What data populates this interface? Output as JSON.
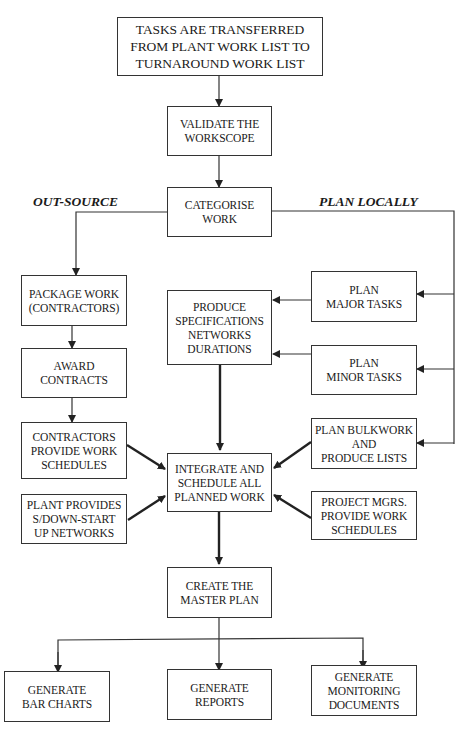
{
  "diagram": {
    "labels": {
      "outsource": "OUT-SOURCE",
      "plan_locally": "PLAN LOCALLY"
    },
    "nodes": {
      "transfer": "TASKS ARE TRANSFERRED\nFROM PLANT WORK LIST TO\nTURNAROUND WORK LIST",
      "validate": "VALIDATE THE\nWORKSCOPE",
      "categorise": "CATEGORISE\nWORK",
      "package": "PACKAGE WORK\n(CONTRACTORS)",
      "award": "AWARD\nCONTRACTS",
      "contractors_schedules": "CONTRACTORS\nPROVIDE WORK\nSCHEDULES",
      "plant_networks": "PLANT PROVIDES\nS/DOWN-START\nUP NETWORKS",
      "produce_specs": "PRODUCE\nSPECIFICATIONS\nNETWORKS\nDURATIONS",
      "plan_major": "PLAN\nMAJOR TASKS",
      "plan_minor": "PLAN\nMINOR TASKS",
      "plan_bulkwork": "PLAN BULKWORK\nAND\nPRODUCE LISTS",
      "project_mgrs": "PROJECT MGRS.\nPROVIDE WORK\nSCHEDULES",
      "integrate": "INTEGRATE AND\nSCHEDULE ALL\nPLANNED WORK",
      "master_plan": "CREATE THE\nMASTER PLAN",
      "bar_charts": "GENERATE\nBAR CHARTS",
      "reports": "GENERATE\nREPORTS",
      "monitoring": "GENERATE\nMONITORING\nDOCUMENTS"
    },
    "edges": [
      [
        "transfer",
        "validate"
      ],
      [
        "validate",
        "categorise"
      ],
      [
        "categorise",
        "package"
      ],
      [
        "categorise",
        "plan_major"
      ],
      [
        "categorise",
        "plan_minor"
      ],
      [
        "categorise",
        "plan_bulkwork"
      ],
      [
        "package",
        "award"
      ],
      [
        "award",
        "contractors_schedules"
      ],
      [
        "plan_major",
        "produce_specs"
      ],
      [
        "plan_minor",
        "produce_specs"
      ],
      [
        "produce_specs",
        "integrate"
      ],
      [
        "contractors_schedules",
        "integrate"
      ],
      [
        "plant_networks",
        "integrate"
      ],
      [
        "plan_bulkwork",
        "integrate"
      ],
      [
        "project_mgrs",
        "integrate"
      ],
      [
        "integrate",
        "master_plan"
      ],
      [
        "master_plan",
        "bar_charts"
      ],
      [
        "master_plan",
        "reports"
      ],
      [
        "master_plan",
        "monitoring"
      ]
    ]
  }
}
